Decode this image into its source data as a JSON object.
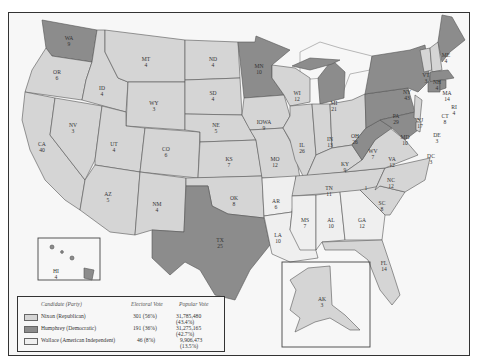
{
  "colors": {
    "republican": "#d5d5d5",
    "democratic": "#8c8c8c",
    "independent": "#efefef",
    "background": "#f7f7f7"
  },
  "states": [
    {
      "abbr": "WA",
      "ev": "9",
      "winner": "democratic"
    },
    {
      "abbr": "OR",
      "ev": "6",
      "winner": "republican"
    },
    {
      "abbr": "CA",
      "ev": "40",
      "winner": "republican"
    },
    {
      "abbr": "NV",
      "ev": "3",
      "winner": "republican"
    },
    {
      "abbr": "ID",
      "ev": "4",
      "winner": "republican"
    },
    {
      "abbr": "MT",
      "ev": "4",
      "winner": "republican"
    },
    {
      "abbr": "WY",
      "ev": "3",
      "winner": "republican"
    },
    {
      "abbr": "UT",
      "ev": "4",
      "winner": "republican"
    },
    {
      "abbr": "AZ",
      "ev": "5",
      "winner": "republican"
    },
    {
      "abbr": "CO",
      "ev": "6",
      "winner": "republican"
    },
    {
      "abbr": "NM",
      "ev": "4",
      "winner": "republican"
    },
    {
      "abbr": "ND",
      "ev": "4",
      "winner": "republican"
    },
    {
      "abbr": "SD",
      "ev": "4",
      "winner": "republican"
    },
    {
      "abbr": "NE",
      "ev": "5",
      "winner": "republican"
    },
    {
      "abbr": "KS",
      "ev": "7",
      "winner": "republican"
    },
    {
      "abbr": "OK",
      "ev": "8",
      "winner": "republican"
    },
    {
      "abbr": "TX",
      "ev": "25",
      "winner": "democratic"
    },
    {
      "abbr": "MN",
      "ev": "10",
      "winner": "democratic"
    },
    {
      "abbr": "IOWA",
      "ev": "9",
      "winner": "republican"
    },
    {
      "abbr": "MO",
      "ev": "12",
      "winner": "republican"
    },
    {
      "abbr": "AR",
      "ev": "6",
      "winner": "independent"
    },
    {
      "abbr": "LA",
      "ev": "10",
      "winner": "independent"
    },
    {
      "abbr": "WI",
      "ev": "12",
      "winner": "republican"
    },
    {
      "abbr": "IL",
      "ev": "26",
      "winner": "republican"
    },
    {
      "abbr": "MI",
      "ev": "21",
      "winner": "democratic"
    },
    {
      "abbr": "IN",
      "ev": "13",
      "winner": "republican"
    },
    {
      "abbr": "OH",
      "ev": "26",
      "winner": "republican"
    },
    {
      "abbr": "KY",
      "ev": "9",
      "winner": "republican"
    },
    {
      "abbr": "TN",
      "ev": "11",
      "winner": "republican"
    },
    {
      "abbr": "MS",
      "ev": "7",
      "winner": "independent"
    },
    {
      "abbr": "AL",
      "ev": "10",
      "winner": "independent"
    },
    {
      "abbr": "GA",
      "ev": "12",
      "winner": "independent"
    },
    {
      "abbr": "FL",
      "ev": "14",
      "winner": "republican"
    },
    {
      "abbr": "SC",
      "ev": "8",
      "winner": "republican"
    },
    {
      "abbr": "NC",
      "ev": "12",
      "winner": "republican"
    },
    {
      "abbr": "NC-faithless",
      "ev": "1",
      "winner": "independent"
    },
    {
      "abbr": "VA",
      "ev": "12",
      "winner": "republican"
    },
    {
      "abbr": "WV",
      "ev": "7",
      "winner": "democratic"
    },
    {
      "abbr": "PA",
      "ev": "29",
      "winner": "democratic"
    },
    {
      "abbr": "NY",
      "ev": "43",
      "winner": "democratic"
    },
    {
      "abbr": "MD",
      "ev": "10",
      "winner": "democratic"
    },
    {
      "abbr": "DE",
      "ev": "3",
      "winner": "republican"
    },
    {
      "abbr": "DC",
      "ev": "3",
      "winner": "democratic"
    },
    {
      "abbr": "NJ",
      "ev": "17",
      "winner": "republican"
    },
    {
      "abbr": "CT",
      "ev": "8",
      "winner": "democratic"
    },
    {
      "abbr": "RI",
      "ev": "4",
      "winner": "democratic"
    },
    {
      "abbr": "MA",
      "ev": "14",
      "winner": "democratic"
    },
    {
      "abbr": "VT",
      "ev": "3",
      "winner": "republican"
    },
    {
      "abbr": "NH",
      "ev": "4",
      "winner": "republican"
    },
    {
      "abbr": "ME",
      "ev": "4",
      "winner": "democratic"
    },
    {
      "abbr": "HI",
      "ev": "4",
      "winner": "democratic"
    },
    {
      "abbr": "AK",
      "ev": "3",
      "winner": "republican"
    }
  ],
  "legend": {
    "header_candidate": "Candidate (Party)",
    "header_electoral": "Electoral Vote",
    "header_popular": "Popular Vote",
    "rows": [
      {
        "candidate": "Nixon (Republican)",
        "electoral": "301 (56%)",
        "popular": "31,785,480 (43.4%)",
        "party": "republican"
      },
      {
        "candidate": "Humphrey (Democratic)",
        "electoral": "191 (36%)",
        "popular": "31,275,165 (42.7%)",
        "party": "democratic"
      },
      {
        "candidate": "Wallace (American Independent)",
        "electoral": "46 (8%)",
        "popular": "9,906,473 (13.5%)",
        "party": "independent"
      }
    ]
  }
}
